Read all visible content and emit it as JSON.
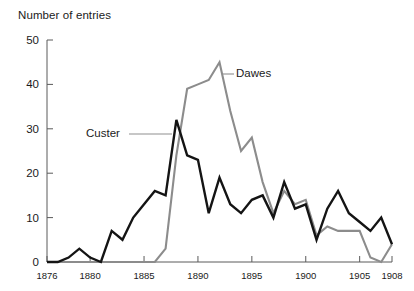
{
  "chart_data": {
    "type": "line",
    "title": "",
    "ylabel": "Number of entries",
    "xlabel": "",
    "ylim": [
      0,
      50
    ],
    "xlim": [
      1876,
      1908
    ],
    "grid": false,
    "legend_position": "inline-annotations",
    "ytick_labels": [
      "0",
      "10",
      "20",
      "30",
      "40",
      "50"
    ],
    "ytick_values": [
      0,
      10,
      20,
      30,
      40,
      50
    ],
    "xtick_labels": [
      "1876",
      "1880",
      "1885",
      "1890",
      "1895",
      "1900",
      "1905",
      "1908"
    ],
    "xtick_values": [
      1876,
      1880,
      1885,
      1890,
      1895,
      1900,
      1905,
      1908
    ],
    "x": [
      1876,
      1877,
      1878,
      1879,
      1880,
      1881,
      1882,
      1883,
      1884,
      1885,
      1886,
      1887,
      1888,
      1889,
      1890,
      1891,
      1892,
      1893,
      1894,
      1895,
      1896,
      1897,
      1898,
      1899,
      1900,
      1901,
      1902,
      1903,
      1904,
      1905,
      1906,
      1907,
      1908
    ],
    "series": [
      {
        "name": "Custer",
        "color": "#141414",
        "values": [
          0,
          0,
          1,
          3,
          1,
          0,
          7,
          5,
          10,
          13,
          16,
          15,
          32,
          24,
          23,
          11,
          19,
          13,
          11,
          14,
          15,
          10,
          18,
          12,
          13,
          5,
          12,
          16,
          11,
          9,
          7,
          10,
          4
        ]
      },
      {
        "name": "Dawes",
        "color": "#8c8c8c",
        "values": [
          0,
          0,
          0,
          0,
          0,
          0,
          0,
          0,
          0,
          0,
          0,
          3,
          24,
          39,
          40,
          41,
          45,
          34,
          25,
          28,
          18,
          11,
          16,
          13,
          14,
          6,
          8,
          7,
          7,
          7,
          1,
          0,
          4
        ]
      }
    ],
    "annotations": [
      {
        "text": "Custer",
        "series": "Custer"
      },
      {
        "text": "Dawes",
        "series": "Dawes"
      }
    ]
  },
  "labels": {
    "axis_title": "Number of entries",
    "custer": "Custer",
    "dawes": "Dawes"
  }
}
